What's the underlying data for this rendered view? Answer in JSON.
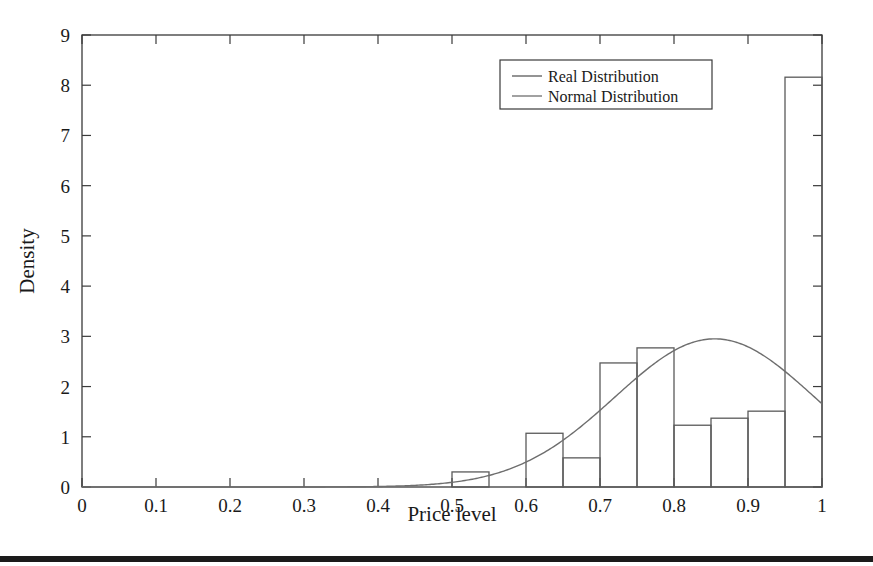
{
  "figure": {
    "background_color": "#ffffff",
    "frame_color": "#3a3a3a",
    "bottom_rule_color": "#1b1b1b"
  },
  "chart_data": {
    "type": "bar",
    "title": "",
    "xlabel": "Price level",
    "ylabel": "Density",
    "xlim": [
      0,
      1
    ],
    "ylim": [
      0,
      9
    ],
    "grid": false,
    "legend_position": "top-right",
    "xticks": [
      "0",
      "0.1",
      "0.2",
      "0.3",
      "0.4",
      "0.5",
      "0.6",
      "0.7",
      "0.8",
      "0.9",
      "1"
    ],
    "xtick_values": [
      0,
      0.1,
      0.2,
      0.3,
      0.4,
      0.5,
      0.6,
      0.7,
      0.8,
      0.9,
      1
    ],
    "yticks": [
      "0",
      "1",
      "2",
      "3",
      "4",
      "5",
      "6",
      "7",
      "8",
      "9"
    ],
    "ytick_values": [
      0,
      1,
      2,
      3,
      4,
      5,
      6,
      7,
      8,
      9
    ],
    "bin_width": 0.05,
    "series": [
      {
        "name": "Real Distribution",
        "kind": "histogram",
        "color": "#5a5a5a",
        "bin_edges": [
          0.0,
          0.05,
          0.1,
          0.15,
          0.2,
          0.25,
          0.3,
          0.35,
          0.4,
          0.45,
          0.5,
          0.55,
          0.6,
          0.65,
          0.7,
          0.75,
          0.8,
          0.85,
          0.9,
          0.95,
          1.0
        ],
        "values": [
          0,
          0,
          0,
          0,
          0,
          0,
          0,
          0,
          0,
          0,
          0.3,
          0,
          1.07,
          0.58,
          2.47,
          2.77,
          1.23,
          1.37,
          1.51,
          8.16
        ]
      },
      {
        "name": "Normal Distribution",
        "kind": "line",
        "color": "#6e6e6e",
        "mean": 0.855,
        "std": 0.135,
        "peak_x": 0.85,
        "peak_y": 2.95,
        "x": [
          0.0,
          0.05,
          0.1,
          0.15,
          0.2,
          0.25,
          0.3,
          0.35,
          0.4,
          0.45,
          0.5,
          0.55,
          0.6,
          0.65,
          0.7,
          0.75,
          0.8,
          0.85,
          0.9,
          0.95,
          1.0
        ],
        "values": [
          0.0,
          0.0,
          0.0,
          0.0,
          0.0,
          0.01,
          0.02,
          0.05,
          0.11,
          0.23,
          0.44,
          0.76,
          1.19,
          1.71,
          2.25,
          2.68,
          2.92,
          2.95,
          2.74,
          2.3,
          1.53
        ]
      }
    ],
    "legend": [
      {
        "label": "Real Distribution",
        "color": "#5a5a5a"
      },
      {
        "label": "Normal Distribution",
        "color": "#6e6e6e"
      }
    ]
  }
}
